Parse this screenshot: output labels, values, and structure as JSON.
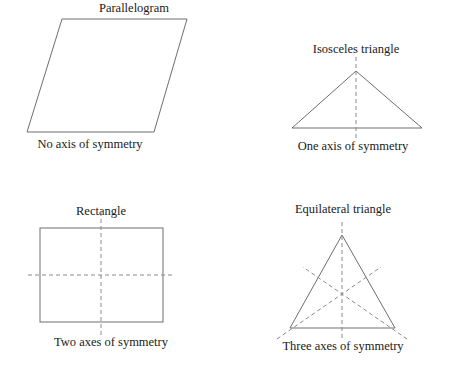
{
  "figure": {
    "background_color": "#ffffff",
    "stroke_color": "#6e6e6e",
    "dash_color": "#8a8a8a",
    "text_color": "#1a1a1a"
  },
  "panels": [
    {
      "id": "parallelogram",
      "shape_name": "Parallelogram",
      "caption": "No axis of symmetry",
      "axes_count": 0,
      "shape_type": "parallelogram",
      "vertices": [
        [
          62,
          19
        ],
        [
          187,
          19
        ],
        [
          154,
          132
        ],
        [
          27,
          132
        ]
      ],
      "axes": []
    },
    {
      "id": "isosceles",
      "shape_name": "Isosceles triangle",
      "caption": "One axis of symmetry",
      "axes_count": 1,
      "shape_type": "triangle",
      "vertices": [
        [
          356,
          71
        ],
        [
          422,
          128
        ],
        [
          292,
          128
        ]
      ],
      "axes": [
        [
          [
            356,
            57
          ],
          [
            356,
            140
          ]
        ]
      ]
    },
    {
      "id": "rectangle",
      "shape_name": "Rectangle",
      "caption": "Two axes of symmetry",
      "axes_count": 2,
      "shape_type": "rectangle",
      "vertices": [
        [
          40,
          228
        ],
        [
          163,
          228
        ],
        [
          163,
          322
        ],
        [
          40,
          322
        ]
      ],
      "axes": [
        [
          [
            101,
            212
          ],
          [
            101,
            336
          ]
        ],
        [
          [
            28,
            275
          ],
          [
            175,
            275
          ]
        ]
      ]
    },
    {
      "id": "equilateral",
      "shape_name": "Equilateral triangle",
      "caption": "Three axes of symmetry",
      "axes_count": 3,
      "shape_type": "triangle",
      "vertices": [
        [
          342,
          235
        ],
        [
          395,
          328
        ],
        [
          290,
          328
        ]
      ],
      "axes": [
        [
          [
            342,
            222
          ],
          [
            342,
            341
          ]
        ],
        [
          [
            277,
            339
          ],
          [
            381,
            267
          ]
        ],
        [
          [
            407,
            339
          ],
          [
            303,
            267
          ]
        ]
      ]
    }
  ],
  "labels": {
    "parallelogram_title": "Parallelogram",
    "parallelogram_caption": "No axis of symmetry",
    "isosceles_title": "Isosceles triangle",
    "isosceles_caption": "One axis of symmetry",
    "rectangle_title": "Rectangle",
    "rectangle_caption": "Two axes of symmetry",
    "equilateral_title": "Equilateral triangle",
    "equilateral_caption": "Three axes of symmetry"
  }
}
